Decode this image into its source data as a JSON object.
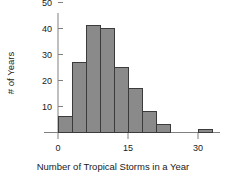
{
  "chart_data": {
    "type": "bar",
    "title": "",
    "subtitle": "",
    "xlabel": "Number of Tropical Storms in a Year",
    "ylabel": "# of Years",
    "grid": false,
    "legend": null,
    "legend_position": "none",
    "bin_width": 3,
    "bin_starts": [
      0,
      3,
      6,
      9,
      12,
      15,
      18,
      21,
      30
    ],
    "categories": [
      "0-3",
      "3-6",
      "6-9",
      "9-12",
      "12-15",
      "15-18",
      "18-21",
      "21-24",
      "30-33"
    ],
    "values": [
      6,
      27,
      41,
      40,
      25,
      17,
      8,
      3,
      1
    ],
    "xlim": [
      -2,
      36
    ],
    "ylim": [
      0,
      52
    ],
    "xticks": [
      0,
      15,
      30
    ],
    "xtick_labels": [
      "0",
      "15",
      "30"
    ],
    "yticks": [
      10,
      20,
      30,
      40,
      50
    ],
    "ytick_labels": [
      "10",
      "20",
      "30",
      "40",
      "50"
    ],
    "bar_fill": "#8a8a8a",
    "bar_stroke": "#3b3b3b",
    "axis_color": "#808080",
    "text_color": "#1a1a1a"
  }
}
